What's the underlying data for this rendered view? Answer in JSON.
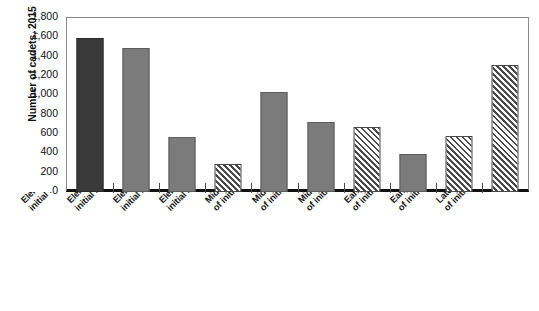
{
  "chart_data": {
    "type": "bar",
    "title": "",
    "xlabel": "",
    "ylabel": "Number of cadets, 2015",
    "ylim": [
      0,
      1800
    ],
    "ytick_step": 200,
    "grid": false,
    "legend": "none",
    "yticks": [
      "1,800",
      "1,600",
      "1,400",
      "1,200",
      "1,000",
      "800",
      "600",
      "400",
      "200",
      "0"
    ],
    "ytick_values": [
      1800,
      1600,
      1400,
      1200,
      1000,
      800,
      600,
      400,
      200,
      0
    ],
    "categories": [
      "Elem--> Elem (41% of initial Elem scores)",
      "Elem--> Middle (38% of initial Elem scores)",
      "Elem--> Early HS (14% of initial Elem scores)",
      "Elem--> Late HS (7% of initial Elem scores)",
      "Middle--> Middle (41% of initial Middle scores)",
      "Middle--> Early HS (29% of initial Middle Scores)",
      "Middle--> Late HS (28% of initial Middle scores)",
      "Early HS--> Early HS (39% of initial early HS scores)",
      "Early HS--> Late HS (59% of initial late HS scores)",
      "Late HS--> Late HS (98% of initial late HS scores)"
    ],
    "category_lines": [
      [
        "Elem--> Elem (41% of",
        "initial Elem scores)"
      ],
      [
        "Elem--> Middle (38% of",
        "initial Elem scores)"
      ],
      [
        "Elem--> Early HS (14% of",
        "initial Elem scores)"
      ],
      [
        "Elem--> Late HS (7% of",
        "initial Elem scores)"
      ],
      [
        "Middle--> Middle (41%",
        "of initial Middle scores)"
      ],
      [
        "Middle--> Early HS (29%",
        "of initial Middle Scores)"
      ],
      [
        "Middle--> Late HS (28%",
        "of initial Middle scores)"
      ],
      [
        "Early HS--> Early HS (39%",
        "of initial early HS scores)"
      ],
      [
        "Early HS--> Late HS (59%",
        "of initial late HS scores)"
      ],
      [
        "Late HS--> Late HS (98%",
        "of initial late HS scores)"
      ]
    ],
    "values": [
      1590,
      1490,
      570,
      290,
      1030,
      720,
      670,
      390,
      580,
      1310
    ],
    "bar_styles": [
      "dark",
      "gray",
      "gray",
      "hatch",
      "gray",
      "gray",
      "hatch",
      "gray",
      "hatch",
      "hatch"
    ],
    "colors": {
      "dark": "#3a3a3a",
      "gray": "#7b7b7b",
      "hatch_line": "#4a4a4a",
      "hatch_background": "#ffffff",
      "axis": "#111111",
      "frame": "#8a8a8a"
    }
  }
}
